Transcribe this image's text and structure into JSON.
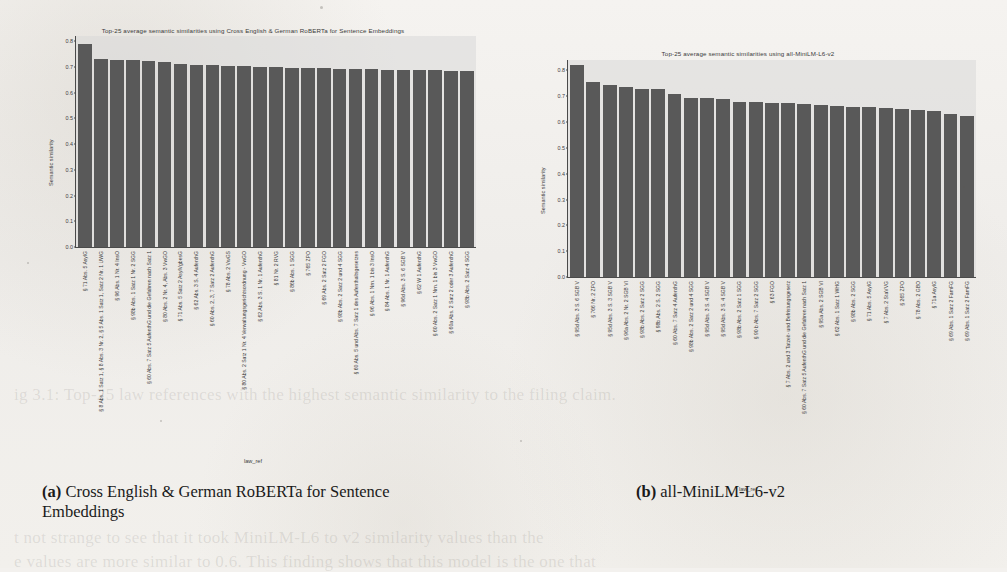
{
  "figure": {
    "xaxis_title": "law_ref",
    "yaxis_title": "Semantic similarity",
    "yticks": [
      "0.0",
      "0.1",
      "0.2",
      "0.3",
      "0.4",
      "0.5",
      "0.6",
      "0.7",
      "0.8"
    ],
    "bar_color": "#595959",
    "plot_bg_color": "#d8d8d8",
    "page_bg_color": "#f3f1ee"
  },
  "captions": {
    "a_marker": "(a)",
    "a_text": "Cross English & German RoBERTa for Sentence Embeddings",
    "b_marker": "(b)",
    "b_text": "all-MiniLM-L6-v2"
  },
  "ghost_text": {
    "line1": "ig 3.1: Top-25 law references with the highest semantic similarity to the filing claim.",
    "line2": "t not strange to see that it took MiniLM-L6 to v2 similarity values than the",
    "line3": "e values are more similar to 0.6. This finding shows that this model is the one that"
  },
  "chart_data": [
    {
      "type": "bar",
      "panel": "a",
      "title": "Top-25 average semantic similarities using Cross English & German RoBERTa for Sentence Embeddings",
      "xlabel": "law_ref",
      "ylabel": "Semantic similarity",
      "ylim": [
        0.0,
        0.82
      ],
      "yticks": [
        0.0,
        0.1,
        0.2,
        0.3,
        0.4,
        0.5,
        0.6,
        0.7,
        0.8
      ],
      "grid": false,
      "legend": "none",
      "categories": [
        "§ 71 Abs. 5 AsylG",
        "§ 8 Abs. 1 Satz 1, § 8 Abs. 3 Nr. 2, § 5 Abs. 1 Satz 1, Satz 2 Nr. 1 UWG",
        "§ 96 Abs. 1 Nr. 4 InsO",
        "§ 98b Abs. 1 Satz 1 Nr. 2 SGG",
        "§ 60 Abs. 7 Satz 5 AufenthG und die Gefahren nach Satz 1",
        "§ 80 Abs. 2 Nr. 4, Abs. 3 VwGO",
        "§ 71 Abs. 5 Satz 2 AsylVgbesG",
        "§ 62 Abs. 3 S. 4 AufenthG",
        "§ 60 Abs. 2, 3, 7 Satz 2 AufenthG",
        "§ 78 Abs. 2 VwGS",
        "§ 80 Abs. 2 Satz 1 Nr. 4 Verwaltungsgerichtsordnung - VwGO",
        "§ 62 Abs. 3 S. 1 Nr. 1 AufenthG",
        "§ 81 Nr. 2 RVG",
        "§ 86b Abs. 1 SGG",
        "§ 765 ZPO",
        "§ 69 Abs. 2 Satz 2 FGO",
        "§ 98b Abs. 2 Satz 2 und 4 SGG",
        "§ 60 Abs. 5 und Abs. 7 Satz 1 des Aufenthaltsgesetzes",
        "§ 96 Abs. 1 Nrn. 1 bis 3 InsO",
        "§ 84 Abs. 1 Nr. 1 AufenthG",
        "§ 96d Abs. 3 S. 6 SGB V",
        "§ 62 W 1 AufenthG",
        "§ 60 Abs. 2 Satz 1 Nrn. 1 bis 3 VwGO",
        "§ 60a Abs. 2 Satz 2 oder 3 AufenthG",
        "§ 98b Abs. 2 Satz 4 SGG"
      ],
      "values": [
        0.79,
        0.732,
        0.726,
        0.726,
        0.724,
        0.718,
        0.712,
        0.708,
        0.706,
        0.704,
        0.702,
        0.7,
        0.698,
        0.696,
        0.695,
        0.694,
        0.692,
        0.691,
        0.69,
        0.689,
        0.688,
        0.687,
        0.686,
        0.685,
        0.684
      ]
    },
    {
      "type": "bar",
      "panel": "b",
      "title": "Top-25 average semantic similarities using all-MiniLM-L6-v2",
      "xlabel": "law_ref",
      "ylabel": "Semantic similarity",
      "ylim": [
        0.0,
        0.84
      ],
      "yticks": [
        0.0,
        0.1,
        0.2,
        0.3,
        0.4,
        0.5,
        0.6,
        0.7,
        0.8
      ],
      "grid": false,
      "legend": "none",
      "categories": [
        "§ 95d Abs. 3 S. 6 SGB V",
        "§ 766 Nr. 2 ZPO",
        "§ 95d Abs. 3 S. 3 SGB V",
        "§ 96a Abs. 2 Nr. 2 SGB VI",
        "§ 98b Abs. 2 Satz 2 SGG",
        "§ 98b Abs. 2 S. 2 SGG",
        "§ 60 Abs. 7 Satz 4 AufenthG",
        "§ 98b Abs. 2 Satz 2 und 4 SGG",
        "§ 95d Abs. 3 S. 4 SGB V",
        "§ 95d Abs. 3 S. 4 SGB V",
        "§ 98b Abs. 2 Satz 1 SGG",
        "§ 90 b Abs. 7 Satz 2 SGG",
        "§ 63 FGO",
        "§ 7 Abs. 2 und 3 Tatzeit- und Befristungsgesetz",
        "§ 60 Abs. 7 Satz 5 AufenthG und die Gefahren nach Satz 1",
        "§ 95a Abs. 2 SGB VI",
        "§ 62 Abs. 1 Satz 1 WHG",
        "§ 98b Abs. 2 SGG",
        "§ 71 Abs. 5 AsylG",
        "§ 7 Abs. 2 StaVVG",
        "§ 265 ZPO",
        "§ 78 Abs. 2 GBO",
        "§ 71a AsylG",
        "§ 69 Abs. 1 Satz 2 FamFG",
        "§ 69 Abs. 1 Satz 2 FamFG"
      ],
      "values": [
        0.82,
        0.755,
        0.745,
        0.737,
        0.728,
        0.727,
        0.707,
        0.694,
        0.692,
        0.691,
        0.677,
        0.676,
        0.675,
        0.673,
        0.671,
        0.666,
        0.663,
        0.66,
        0.657,
        0.653,
        0.65,
        0.647,
        0.644,
        0.632,
        0.622
      ]
    }
  ]
}
